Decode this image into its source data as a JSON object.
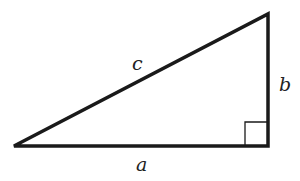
{
  "diagram": {
    "type": "right-triangle",
    "labels": {
      "hypotenuse": "c",
      "vertical_leg": "b",
      "horizontal_leg": "a"
    },
    "stroke_color": "#1a1a1a",
    "right_angle_marker": true
  }
}
